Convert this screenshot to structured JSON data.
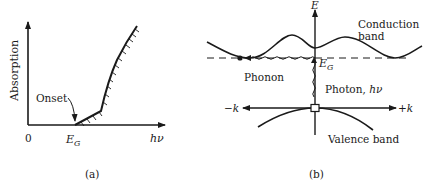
{
  "figure": {
    "panel_a": {
      "caption": "(a)",
      "y_axis_label": "Absorption",
      "x_axis_label": "hν",
      "origin_label": "0",
      "gap_label": "E",
      "gap_subscript": "G",
      "annotation": "Onset"
    },
    "panel_b": {
      "caption": "(b)",
      "energy_axis_label": "E",
      "conduction_band_label_line1": "Conduction",
      "conduction_band_label_line2": "band",
      "gap_label": "E",
      "gap_subscript": "G",
      "phonon_label": "Phonon",
      "photon_label": "Photon, ",
      "photon_symbol": "hν",
      "neg_k_label": "−k",
      "pos_k_label": "+k",
      "valence_band_label": "Valence band"
    },
    "colors": {
      "ink": "#1a1a1a",
      "background": "#ffffff"
    }
  }
}
